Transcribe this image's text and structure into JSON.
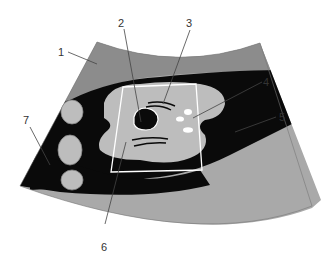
{
  "diagram": {
    "type": "ultrasound-schematic",
    "colors": {
      "background": "#ffffff",
      "near_field": "#8c8c8c",
      "far_field": "#a9a9a9",
      "fluid": "#0a0a0a",
      "organ": "#bdbdbd",
      "outline": "#ffffff",
      "label_text": "#333333"
    },
    "labels": [
      {
        "id": "1",
        "text": "1"
      },
      {
        "id": "2",
        "text": "2"
      },
      {
        "id": "3",
        "text": "3"
      },
      {
        "id": "4",
        "text": "4"
      },
      {
        "id": "5",
        "text": "5"
      },
      {
        "id": "6",
        "text": "6"
      },
      {
        "id": "7",
        "text": "7"
      }
    ]
  }
}
